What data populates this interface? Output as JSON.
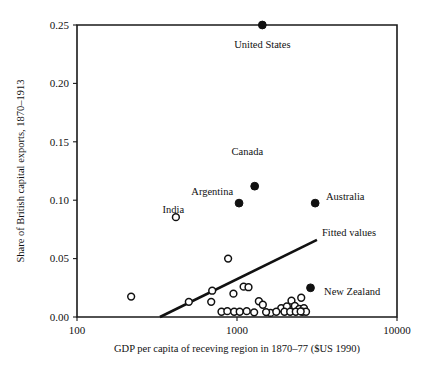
{
  "chart_data": {
    "type": "scatter",
    "title": "",
    "xlabel": "GDP per capita of receving region in 1870–77 ($US 1990)",
    "ylabel": "Share of British capital exports, 1870–1913",
    "xscale": "log",
    "yscale": "linear",
    "xlim": [
      100,
      10000
    ],
    "ylim": [
      0.0,
      0.25
    ],
    "xticks": [
      100,
      1000,
      10000
    ],
    "xtick_labels": [
      "100",
      "1000",
      "10000"
    ],
    "yticks": [
      0.0,
      0.05,
      0.1,
      0.15,
      0.2,
      0.25
    ],
    "ytick_labels": [
      "0.00",
      "0.05",
      "0.10",
      "0.15",
      "0.20",
      "0.25"
    ],
    "grid": false,
    "legend": "none",
    "annotations": [
      {
        "text": "United States",
        "x": 1440,
        "y": 0.2305,
        "anchor": "middle"
      },
      {
        "text": "Canada",
        "x": 1160,
        "y": 0.1385,
        "anchor": "middle"
      },
      {
        "text": "Argentina",
        "x": 700,
        "y": 0.1048,
        "anchor": "middle"
      },
      {
        "text": "Australia",
        "x": 3600,
        "y": 0.1005,
        "anchor": "start"
      },
      {
        "text": "India",
        "x": 400,
        "y": 0.089,
        "anchor": "middle"
      },
      {
        "text": "Fitted values",
        "x": 3400,
        "y": 0.069,
        "anchor": "start"
      },
      {
        "text": "New Zealand",
        "x": 3500,
        "y": 0.019,
        "anchor": "start"
      }
    ],
    "series": [
      {
        "name": "Labelled destinations",
        "marker": "filled-circle",
        "color": "#111111",
        "points": [
          {
            "label": "United States",
            "x": 1440,
            "y": 0.25
          },
          {
            "label": "Canada",
            "x": 1290,
            "y": 0.112
          },
          {
            "label": "Argentina",
            "x": 1030,
            "y": 0.0975
          },
          {
            "label": "Australia",
            "x": 3080,
            "y": 0.0975
          },
          {
            "label": "New Zealand",
            "x": 2880,
            "y": 0.025
          }
        ]
      },
      {
        "name": "Other receiving regions",
        "marker": "open-circle",
        "color": "#111111",
        "points": [
          {
            "x": 415,
            "y": 0.0855
          },
          {
            "x": 880,
            "y": 0.05
          },
          {
            "x": 700,
            "y": 0.0225
          },
          {
            "x": 1100,
            "y": 0.026
          },
          {
            "x": 1180,
            "y": 0.0255
          },
          {
            "x": 950,
            "y": 0.02
          },
          {
            "x": 218,
            "y": 0.0175
          },
          {
            "x": 1370,
            "y": 0.0135
          },
          {
            "x": 500,
            "y": 0.013
          },
          {
            "x": 690,
            "y": 0.013
          },
          {
            "x": 1450,
            "y": 0.0105
          },
          {
            "x": 2190,
            "y": 0.014
          },
          {
            "x": 2520,
            "y": 0.0165
          },
          {
            "x": 1890,
            "y": 0.0075
          },
          {
            "x": 2050,
            "y": 0.009
          },
          {
            "x": 2300,
            "y": 0.0095
          },
          {
            "x": 2450,
            "y": 0.007
          },
          {
            "x": 2620,
            "y": 0.0075
          },
          {
            "x": 800,
            "y": 0.0045
          },
          {
            "x": 870,
            "y": 0.005
          },
          {
            "x": 960,
            "y": 0.0045
          },
          {
            "x": 1040,
            "y": 0.0045
          },
          {
            "x": 1150,
            "y": 0.005
          },
          {
            "x": 1280,
            "y": 0.004
          },
          {
            "x": 1620,
            "y": 0.0035
          },
          {
            "x": 1760,
            "y": 0.0045
          },
          {
            "x": 1980,
            "y": 0.0045
          },
          {
            "x": 2150,
            "y": 0.0045
          },
          {
            "x": 2330,
            "y": 0.0045
          },
          {
            "x": 2560,
            "y": 0.0045
          },
          {
            "x": 2700,
            "y": 0.0045
          },
          {
            "x": 2500,
            "y": 0.0048
          },
          {
            "x": 1520,
            "y": 0.0042
          }
        ]
      }
    ],
    "fit_line": {
      "name": "Fitted values",
      "x_start": 330,
      "y_start": 0.0,
      "x_end": 3160,
      "y_end": 0.066
    }
  }
}
